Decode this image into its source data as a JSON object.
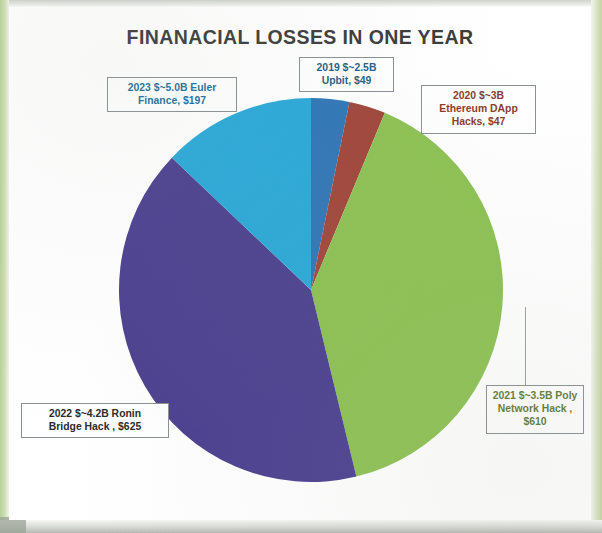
{
  "chart": {
    "title": "FINANACIAL LOSSES IN ONE YEAR"
  },
  "chart_data": {
    "type": "pie",
    "title": "FINANACIAL LOSSES IN ONE YEAR",
    "xlabel": "",
    "ylabel": "",
    "legend_position": "none",
    "grid": false,
    "start_angle_deg": 0,
    "direction": "clockwise",
    "total": 1528,
    "categories": [
      "2019 $~2.5B Upbit",
      "2020 $~3B Ethereum DApp Hacks",
      "2021 $~3.5B Poly Network Hack",
      "2022 $~4.2B Ronin Bridge Hack",
      "2023 $~5.0B Euler Finance"
    ],
    "values": [
      49,
      47,
      610,
      625,
      197
    ],
    "percents": [
      3.2,
      3.1,
      39.9,
      40.9,
      12.9
    ],
    "colors": [
      "#2e75b6",
      "#a0453a",
      "#8cc152",
      "#4b3f8f",
      "#29a8d8"
    ],
    "slices": [
      {
        "name": "2019 $~2.5B Upbit",
        "year": "2019",
        "amount_label": "$~2.5B",
        "entity": "Upbit",
        "value": 49,
        "value_label": "$49",
        "percent": 3.2,
        "color": "#2e75b6",
        "label_text": "2019 $~2.5B\nUpbit, $49"
      },
      {
        "name": "2020 $~3B Ethereum DApp Hacks",
        "year": "2020",
        "amount_label": "$~3B",
        "entity": "Ethereum DApp Hacks",
        "value": 47,
        "value_label": "$47",
        "percent": 3.1,
        "color": "#a0453a",
        "label_text": "2020 $~3B\nEthereum DApp\nHacks, $47"
      },
      {
        "name": "2021 $~3.5B Poly Network Hack",
        "year": "2021",
        "amount_label": "$~3.5B",
        "entity": "Poly Network Hack",
        "value": 610,
        "value_label": "$610",
        "percent": 39.9,
        "color": "#8cc152",
        "label_text": "2021 $~3.5B Poly\nNetwork Hack ,\n$610"
      },
      {
        "name": "2022 $~4.2B Ronin Bridge Hack",
        "year": "2022",
        "amount_label": "$~4.2B",
        "entity": "Ronin Bridge Hack",
        "value": 625,
        "value_label": "$625",
        "percent": 40.9,
        "color": "#4b3f8f",
        "label_text": "2022 $~4.2B Ronin\nBridge Hack , $625"
      },
      {
        "name": "2023 $~5.0B Euler Finance",
        "year": "2023",
        "amount_label": "$~5.0B",
        "entity": "Euler Finance",
        "value": 197,
        "value_label": "$197",
        "percent": 12.9,
        "color": "#29a8d8",
        "label_text": "2023 $~5.0B  Euler\nFinance, $197"
      }
    ]
  }
}
